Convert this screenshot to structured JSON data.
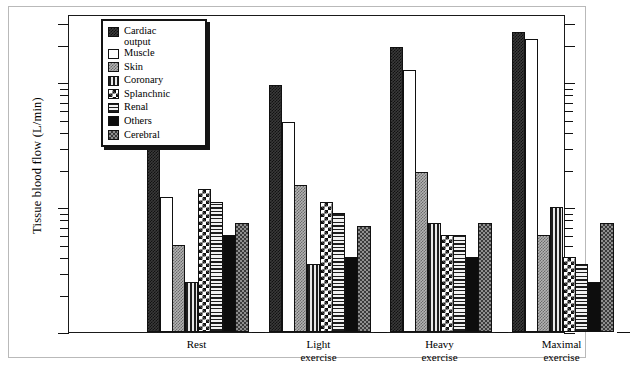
{
  "figure": {
    "ylabel": "Tissue blood flow (L/min)",
    "caption": ""
  },
  "legend": {
    "items": [
      {
        "label": "Cardiac\noutput",
        "pattern": "p-cardiac",
        "key": "cardiac_output"
      },
      {
        "label": "Muscle",
        "pattern": "p-muscle",
        "key": "muscle"
      },
      {
        "label": "Skin",
        "pattern": "p-skin",
        "key": "skin"
      },
      {
        "label": "Coronary",
        "pattern": "p-coronary",
        "key": "coronary"
      },
      {
        "label": "Splanchnic",
        "pattern": "p-splanchnic",
        "key": "splanchnic"
      },
      {
        "label": "Renal",
        "pattern": "p-renal",
        "key": "renal"
      },
      {
        "label": "Others",
        "pattern": "p-others",
        "key": "others"
      },
      {
        "label": "Cerebral",
        "pattern": "p-cerebral",
        "key": "cerebral"
      }
    ]
  },
  "chart_data": {
    "type": "bar",
    "title": "",
    "xlabel": "",
    "ylabel": "Tissue blood flow (L/min)",
    "yscale": "log",
    "ylim": [
      0.1,
      35.0
    ],
    "grid": false,
    "legend_position": "top-left inside",
    "ytick_labels": [
      "30.0",
      "20.0",
      "10.0",
      "9.0",
      "8.0",
      "7.0",
      "6.0",
      "5.0",
      "4.0",
      "3.0",
      "2.0",
      "1.0",
      ".9",
      ".8",
      ".7",
      ".6",
      ".5",
      ".4",
      ".3",
      ".2",
      ".1"
    ],
    "yticks": [
      30.0,
      20.0,
      10.0,
      9.0,
      8.0,
      7.0,
      6.0,
      5.0,
      4.0,
      3.0,
      2.0,
      1.0,
      0.9,
      0.8,
      0.7,
      0.6,
      0.5,
      0.4,
      0.3,
      0.2,
      0.1
    ],
    "categories": [
      "Rest",
      "Light\nexercise",
      "Heavy\nexercise",
      "Maximal\nexercise"
    ],
    "series": [
      {
        "name": "Cardiac output",
        "pattern": "p-cardiac",
        "values": [
          5.8,
          9.5,
          19.0,
          25.0
        ]
      },
      {
        "name": "Muscle",
        "pattern": "p-muscle",
        "values": [
          1.2,
          4.8,
          12.5,
          22.0
        ]
      },
      {
        "name": "Skin",
        "pattern": "p-skin",
        "values": [
          0.5,
          1.5,
          1.9,
          0.6
        ]
      },
      {
        "name": "Coronary",
        "pattern": "p-coronary",
        "values": [
          0.25,
          0.35,
          0.75,
          1.0
        ]
      },
      {
        "name": "Splanchnic",
        "pattern": "p-splanchnic",
        "values": [
          1.4,
          1.1,
          0.6,
          0.4
        ]
      },
      {
        "name": "Renal",
        "pattern": "p-renal",
        "values": [
          1.1,
          0.9,
          0.6,
          0.35
        ]
      },
      {
        "name": "Others",
        "pattern": "p-others",
        "values": [
          0.6,
          0.4,
          0.4,
          0.25
        ]
      },
      {
        "name": "Cerebral",
        "pattern": "p-cerebral",
        "values": [
          0.75,
          0.7,
          0.75,
          0.75
        ]
      }
    ]
  }
}
